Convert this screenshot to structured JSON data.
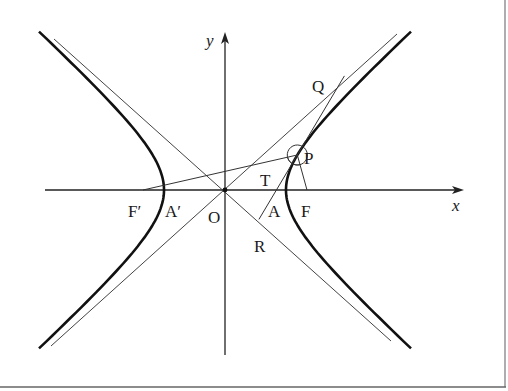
{
  "figure": {
    "axes": {
      "x_label": "x",
      "y_label": "y",
      "origin_label": "O"
    },
    "labels": {
      "F_prime": "F′",
      "A_prime": "A′",
      "O": "O",
      "A": "A",
      "F": "F",
      "T": "T",
      "P": "P",
      "Q": "Q",
      "R": "R"
    },
    "geometry": {
      "origin_px": [
        225,
        190
      ],
      "a_px": 61,
      "b_px": 55,
      "focus_c_px": 82,
      "P_param_t": 0.6
    },
    "colors": {
      "curve": "#111111",
      "line": "#333333",
      "border": "#555555",
      "background": "#ffffff"
    }
  }
}
